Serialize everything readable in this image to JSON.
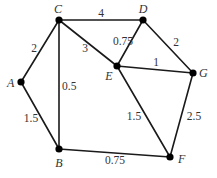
{
  "diagram": {
    "type": "weighted-undirected-graph",
    "nodes": [
      {
        "id": "A",
        "label": "A",
        "x": 21,
        "y": 82,
        "lx": 7,
        "ly": 87,
        "anchor": "start"
      },
      {
        "id": "B",
        "label": "B",
        "x": 59,
        "y": 149,
        "lx": 59,
        "ly": 167,
        "anchor": "middle"
      },
      {
        "id": "C",
        "label": "C",
        "x": 59,
        "y": 20,
        "lx": 58,
        "ly": 13,
        "anchor": "middle"
      },
      {
        "id": "D",
        "label": "D",
        "x": 143,
        "y": 20,
        "lx": 143,
        "ly": 13,
        "anchor": "middle"
      },
      {
        "id": "E",
        "label": "E",
        "x": 117,
        "y": 66,
        "lx": 109,
        "ly": 80,
        "anchor": "middle"
      },
      {
        "id": "F",
        "label": "F",
        "x": 170,
        "y": 157,
        "lx": 178,
        "ly": 163,
        "anchor": "start"
      },
      {
        "id": "G",
        "label": "G",
        "x": 193,
        "y": 73,
        "lx": 199,
        "ly": 77,
        "anchor": "start"
      }
    ],
    "edges": [
      {
        "from": "C",
        "to": "D",
        "weight": "4",
        "lx": 101,
        "ly": 17,
        "anchor": "middle"
      },
      {
        "from": "C",
        "to": "A",
        "weight": "2",
        "lx": 34,
        "ly": 52,
        "anchor": "middle"
      },
      {
        "from": "C",
        "to": "E",
        "weight": "3",
        "lx": 85,
        "ly": 52,
        "anchor": "middle"
      },
      {
        "from": "C",
        "to": "B",
        "weight": "0.5",
        "lx": 62,
        "ly": 90,
        "anchor": "start"
      },
      {
        "from": "D",
        "to": "E",
        "weight": "0.75",
        "lx": 123,
        "ly": 45,
        "anchor": "middle"
      },
      {
        "from": "D",
        "to": "G",
        "weight": "2",
        "lx": 176,
        "ly": 46,
        "anchor": "middle"
      },
      {
        "from": "E",
        "to": "G",
        "weight": "1",
        "lx": 156,
        "ly": 66,
        "anchor": "middle"
      },
      {
        "from": "E",
        "to": "F",
        "weight": "1.5",
        "lx": 134,
        "ly": 120,
        "anchor": "middle"
      },
      {
        "from": "G",
        "to": "F",
        "weight": "2.5",
        "lx": 194,
        "ly": 120,
        "anchor": "middle"
      },
      {
        "from": "A",
        "to": "B",
        "weight": "1.5",
        "lx": 31,
        "ly": 122,
        "anchor": "middle"
      },
      {
        "from": "B",
        "to": "F",
        "weight": "0.75",
        "lx": 115,
        "ly": 164,
        "anchor": "middle"
      }
    ]
  },
  "colors": {
    "edge": "#1a1a1a",
    "node": "#000000",
    "text": "#333333",
    "background": "#ffffff"
  }
}
